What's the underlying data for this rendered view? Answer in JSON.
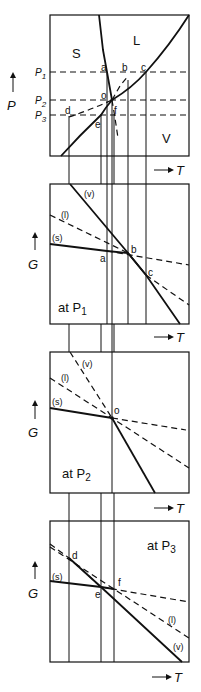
{
  "figure": {
    "phase_diagram": {
      "y_axis": "P",
      "x_axis": "T",
      "regions": [
        "S",
        "L",
        "V"
      ],
      "pressure_labels": [
        "P1",
        "P2",
        "P3"
      ],
      "points": [
        "a",
        "b",
        "c",
        "o",
        "d",
        "e",
        "f"
      ]
    },
    "panels": [
      {
        "id": "p1",
        "caption_prefix": "at P",
        "caption_sub": "1",
        "y_axis": "G",
        "x_axis": "T",
        "curves": [
          "(v)",
          "(l)",
          "(s)"
        ],
        "points": [
          "a",
          "b",
          "c"
        ]
      },
      {
        "id": "p2",
        "caption_prefix": "at P",
        "caption_sub": "2",
        "y_axis": "G",
        "x_axis": "T",
        "curves": [
          "(v)",
          "(l)",
          "(s)"
        ],
        "points": [
          "o"
        ]
      },
      {
        "id": "p3",
        "caption_prefix": "at P",
        "caption_sub": "3",
        "y_axis": "G",
        "x_axis": "T",
        "curves": [
          "(s)",
          "(l)",
          "(v)"
        ],
        "points": [
          "d",
          "e",
          "f"
        ]
      }
    ]
  }
}
